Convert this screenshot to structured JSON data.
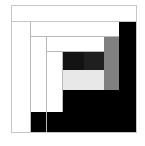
{
  "figure": {
    "name": "log-cabin-quilt-block",
    "width": 145,
    "height": 146,
    "background": "#ffffff"
  },
  "palette": {
    "white": "#ffffff",
    "light_gray": "#e8e8e8",
    "medium_gray": "#808080",
    "dark_gray": "#1c1c1c",
    "black": "#000000",
    "hairline": "#b9b9b9",
    "frame_border": "#c6c6c6"
  },
  "chart_data": {
    "type": "heatmap",
    "xlabel": "",
    "ylabel": "",
    "grid": false,
    "legend": "none",
    "xlim": [
      0,
      145
    ],
    "ylim": [
      0,
      146
    ],
    "categories": [
      "white",
      "light-gray",
      "medium-gray",
      "dark-gray",
      "black"
    ],
    "values": [
      62,
      6,
      9,
      5,
      18
    ],
    "patches": [
      {
        "name": "outer-top-band-white",
        "tone": "white",
        "color": "#ffffff",
        "x": 11,
        "y": 5,
        "w": 126,
        "h": 17
      },
      {
        "name": "left-column-white",
        "tone": "white",
        "color": "#ffffff",
        "x": 11,
        "y": 22,
        "w": 20,
        "h": 111
      },
      {
        "name": "right-column-black",
        "tone": "black",
        "color": "#000000",
        "x": 119,
        "y": 22,
        "w": 18,
        "h": 111
      },
      {
        "name": "upper-band-white",
        "tone": "white",
        "color": "#ffffff",
        "x": 31,
        "y": 22,
        "w": 88,
        "h": 15
      },
      {
        "name": "second-left-white",
        "tone": "white",
        "color": "#ffffff",
        "x": 31,
        "y": 37,
        "w": 16,
        "h": 96
      },
      {
        "name": "bottom-band-black",
        "tone": "black",
        "color": "#000000",
        "x": 31,
        "y": 112,
        "w": 88,
        "h": 21
      },
      {
        "name": "third-top-white",
        "tone": "white",
        "color": "#ffffff",
        "x": 47,
        "y": 37,
        "w": 57,
        "h": 15
      },
      {
        "name": "right-strip-medium-gray",
        "tone": "medium-gray",
        "color": "#808080",
        "x": 104,
        "y": 37,
        "w": 15,
        "h": 53
      },
      {
        "name": "third-left-white",
        "tone": "white",
        "color": "#ffffff",
        "x": 47,
        "y": 52,
        "w": 16,
        "h": 60
      },
      {
        "name": "inner-bottom-black",
        "tone": "black",
        "color": "#000000",
        "x": 63,
        "y": 90,
        "w": 56,
        "h": 22
      },
      {
        "name": "center-dark-left",
        "tone": "dark-gray",
        "color": "#131313",
        "x": 63,
        "y": 52,
        "w": 21,
        "h": 18
      },
      {
        "name": "center-dark-right",
        "tone": "dark-gray",
        "color": "#1f1f1f",
        "x": 84,
        "y": 52,
        "w": 20,
        "h": 18
      },
      {
        "name": "center-light-gray",
        "tone": "light-gray",
        "color": "#e8e8e8",
        "x": 63,
        "y": 70,
        "w": 41,
        "h": 20
      }
    ],
    "rules": [
      {
        "name": "rule-outer-band-bottom",
        "x": 11,
        "y": 21,
        "w": 126,
        "h": 1
      },
      {
        "name": "rule-left-column-right",
        "x": 30,
        "y": 22,
        "w": 1,
        "h": 111
      },
      {
        "name": "rule-upper-band-bottom",
        "x": 31,
        "y": 36,
        "w": 88,
        "h": 1
      },
      {
        "name": "rule-second-left-right",
        "x": 46,
        "y": 37,
        "w": 1,
        "h": 96
      },
      {
        "name": "rule-third-top-bottom",
        "x": 47,
        "y": 51,
        "w": 57,
        "h": 1
      },
      {
        "name": "rule-third-left-right",
        "x": 62,
        "y": 52,
        "w": 1,
        "h": 60
      }
    ],
    "frames": [
      {
        "name": "outer-band-frame",
        "x": 11,
        "y": 5,
        "w": 126,
        "h": 17
      },
      {
        "name": "block-outline",
        "x": 11,
        "y": 21,
        "w": 126,
        "h": 112
      }
    ]
  }
}
